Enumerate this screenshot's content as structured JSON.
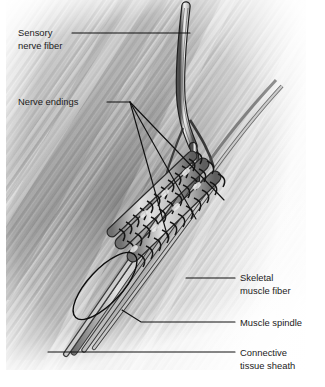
{
  "figure": {
    "type": "anatomical-illustration",
    "style": "grayscale pencil/airbrush medical drawing",
    "canvas": {
      "width": 325,
      "height": 387
    },
    "background_color": "#ffffff"
  },
  "colors": {
    "label_text": "#1b1b1b",
    "leader_line": "#111111",
    "muscle_mid": "#9a9a9a",
    "muscle_dark": "#5d5d5d",
    "muscle_light": "#d8d8d8",
    "nerve_outline": "#232323",
    "sheath_outline": "#0d0d0d",
    "background": "#ffffff"
  },
  "labels": [
    {
      "id": "sensory-nerve-fiber",
      "line1": "Sensory",
      "line2": "nerve fiber",
      "text_x": 18,
      "text_y": 36,
      "align": "start",
      "leader": "M 72,33 L 190,33",
      "target": "sensory nerve bundle entering from top of field"
    },
    {
      "id": "nerve-endings",
      "line1": "Nerve endings",
      "line2": "",
      "text_x": 18,
      "text_y": 105,
      "align": "start",
      "leader": "M 107,102 L 130,102",
      "target": "annulospiral endings wrapped around intrafusal fibers"
    },
    {
      "id": "skeletal-muscle-fiber",
      "line1": "Skeletal",
      "line2": "muscle fiber",
      "text_x": 240,
      "text_y": 281,
      "align": "start",
      "leader": "M 186,278 L 235,278",
      "target": "extrafusal striated muscle fibers"
    },
    {
      "id": "muscle-spindle",
      "line1": "Muscle spindle",
      "line2": "",
      "text_x": 240,
      "text_y": 324,
      "align": "start",
      "leader": "M 122,310 L 141,322 L 235,322",
      "target": "encapsulated muscle spindle organ"
    },
    {
      "id": "connective-tissue-sheath",
      "line1": "Connective",
      "line2": "tissue sheath",
      "text_x": 240,
      "text_y": 358,
      "align": "start",
      "leader": "M 48,352 L 235,352",
      "target": "capsule / perimysial sheath surrounding the spindle"
    }
  ],
  "nerve_ending_leaders": [
    "M 130,102 L 168,238",
    "M 130,102 L 196,219",
    "M 130,102 L 224,200"
  ],
  "structures": [
    {
      "name": "sensory-nerve-bundle",
      "description": "Myelinated sensory nerve fibers descending from upper area, splitting toward spindle"
    },
    {
      "name": "intrafusal-fiber-group",
      "description": "Cluster of intrafusal muscle fibers inside the spindle capsule"
    },
    {
      "name": "annulospiral-endings",
      "description": "Spiral nerve wrappings around the intrafusal fibers"
    },
    {
      "name": "capsule-ellipse",
      "description": "Outlined elliptical capsule at lower portion of spindle"
    },
    {
      "name": "extrafusal-muscle",
      "description": "Diagonally striated skeletal muscle fiber background"
    }
  ]
}
